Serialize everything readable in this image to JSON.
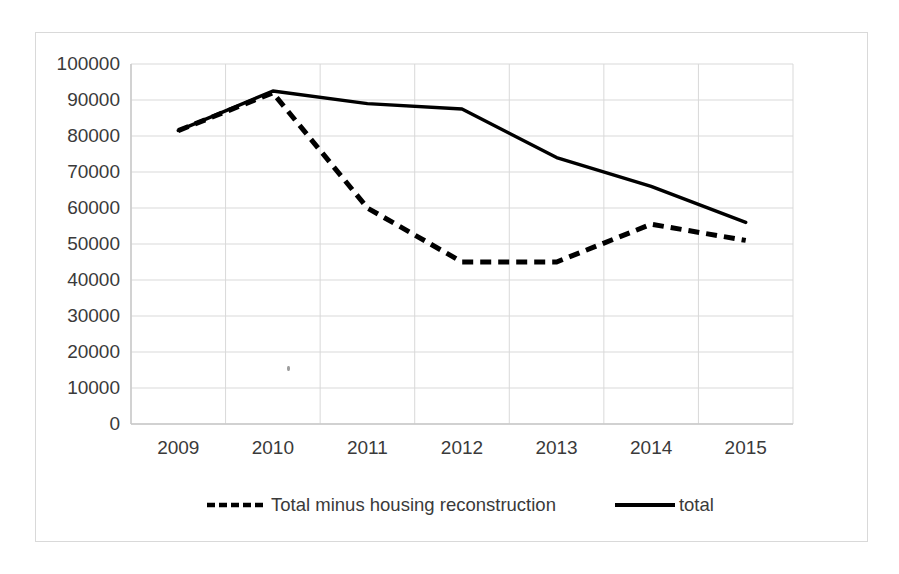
{
  "chart_data": {
    "type": "line",
    "title": "",
    "xlabel": "",
    "ylabel": "",
    "categories": [
      "2009",
      "2010",
      "2011",
      "2012",
      "2013",
      "2014",
      "2015"
    ],
    "x": [
      2009,
      2010,
      2011,
      2012,
      2013,
      2014,
      2015
    ],
    "ylim": [
      0,
      100000
    ],
    "y_ticks": [
      0,
      10000,
      20000,
      30000,
      40000,
      50000,
      60000,
      70000,
      80000,
      90000,
      100000
    ],
    "y_tick_labels": [
      "0",
      "10000",
      "20000",
      "30000",
      "40000",
      "50000",
      "60000",
      "70000",
      "80000",
      "90000",
      "100000"
    ],
    "grid": "horizontal-and-vertical",
    "legend_position": "bottom",
    "series": [
      {
        "name": "Total minus housing reconstruction",
        "style": "dashed",
        "color": "#000000",
        "values": [
          81500,
          92000,
          60000,
          45000,
          45000,
          55500,
          51000
        ]
      },
      {
        "name": "total",
        "style": "solid",
        "color": "#000000",
        "values": [
          81500,
          92500,
          89000,
          87500,
          74000,
          66000,
          56000
        ]
      }
    ]
  },
  "legend": {
    "entries": [
      {
        "label": "Total minus housing reconstruction",
        "marker": "dashed-line-swatch"
      },
      {
        "label": "total",
        "marker": "solid-line-swatch"
      }
    ]
  },
  "colors": {
    "series": "#000000",
    "gridline": "#d9d9d9",
    "frame_border": "#d9d9d9",
    "tick_text": "#3a3a3a",
    "background": "#ffffff"
  }
}
